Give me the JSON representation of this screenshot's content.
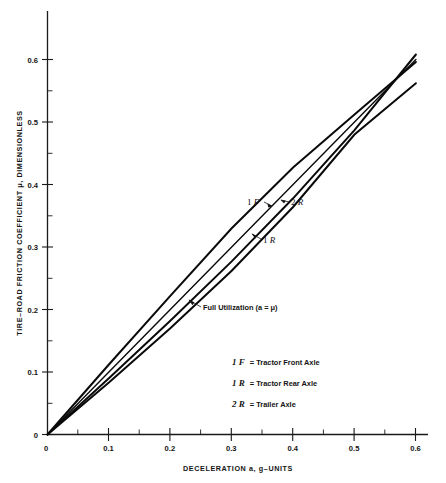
{
  "chart_data": {
    "type": "line",
    "title": "",
    "xlabel": "DECELERATION a, g–UNITS",
    "ylabel": "TIRE–ROAD FRICTION COEFFICIENT μ, DIMENSIONLESS",
    "xlim": [
      0,
      0.62
    ],
    "ylim": [
      0,
      0.615
    ],
    "xticks": [
      "0",
      "0.1",
      "0.2",
      "0.3",
      "0.4",
      "0.5",
      "0.6"
    ],
    "xtick_values": [
      0,
      0.1,
      0.2,
      0.3,
      0.4,
      0.5,
      0.6
    ],
    "yticks": [
      "0",
      "0.1",
      "0.2",
      "0.3",
      "0.4",
      "0.5",
      "0.6"
    ],
    "ytick_values": [
      0,
      0.1,
      0.2,
      0.3,
      0.4,
      0.5,
      0.6
    ],
    "minor_tick_step": 0.05,
    "grid": false,
    "legend_position": "inside-lower-right",
    "x": [
      0,
      0.1,
      0.2,
      0.3,
      0.4,
      0.5,
      0.6
    ],
    "series": [
      {
        "name": "1 F",
        "label": "1 F",
        "description": "Tractor Front Axle",
        "values": [
          0,
          0.112,
          0.222,
          0.33,
          0.427,
          0.512,
          0.596
        ]
      },
      {
        "name": "Full Utilization",
        "label": "Full Utilization (a = μ)",
        "description": "Line where deceleration equals friction coefficient",
        "values": [
          0,
          0.1,
          0.2,
          0.3,
          0.4,
          0.5,
          0.6
        ]
      },
      {
        "name": "1 R",
        "label": "1 R",
        "description": "Tractor Rear Axle",
        "values": [
          0,
          0.09,
          0.182,
          0.277,
          0.378,
          0.487,
          0.608
        ]
      },
      {
        "name": "2 R",
        "label": "2 R",
        "description": "Trailer Axle",
        "values": [
          0,
          0.083,
          0.17,
          0.262,
          0.364,
          0.48,
          0.562
        ]
      }
    ],
    "annotations": [
      {
        "text": "1 F",
        "x": 0.345,
        "y": 0.347
      },
      {
        "text": "2 R",
        "x": 0.432,
        "y": 0.347
      },
      {
        "text": "1 R",
        "x": 0.362,
        "y": 0.272
      },
      {
        "text": "Full Utilization  (a = μ)",
        "x": 0.288,
        "y": 0.205
      }
    ],
    "legend_entries": [
      {
        "symbol": "1 F",
        "equals": "=",
        "text": "Tractor Front Axle"
      },
      {
        "symbol": "1 R",
        "equals": "=",
        "text": "Tractor Rear Axle"
      },
      {
        "symbol": "2 R",
        "equals": "=",
        "text": "Trailer Axle"
      }
    ]
  },
  "figure": {
    "axis_color": "#1a1a1a",
    "curve_color": "#0a0a0a",
    "background": "#ffffff"
  }
}
